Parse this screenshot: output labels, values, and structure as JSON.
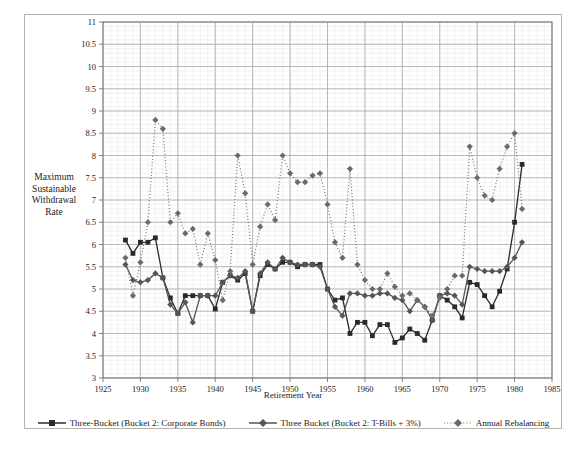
{
  "chart_data": {
    "type": "line",
    "title": "",
    "xlabel": "Retirement Year",
    "ylabel": "Maximum Sustainable Withdrawal Rate",
    "xlim": [
      1925,
      1985
    ],
    "ylim": [
      3,
      11
    ],
    "xticks": [
      1925,
      1930,
      1935,
      1940,
      1945,
      1950,
      1955,
      1960,
      1965,
      1970,
      1975,
      1980,
      1985
    ],
    "yticks": [
      3,
      3.5,
      4,
      4.5,
      5,
      5.5,
      6,
      6.5,
      7,
      7.5,
      8,
      8.5,
      9,
      9.5,
      10,
      10.5,
      11
    ],
    "grid": true,
    "minor_grid": true,
    "legend_position": "bottom",
    "x": [
      1928,
      1929,
      1930,
      1931,
      1932,
      1933,
      1934,
      1935,
      1936,
      1937,
      1938,
      1939,
      1940,
      1941,
      1942,
      1943,
      1944,
      1945,
      1946,
      1947,
      1948,
      1949,
      1950,
      1951,
      1952,
      1953,
      1954,
      1955,
      1956,
      1957,
      1958,
      1959,
      1960,
      1961,
      1962,
      1963,
      1964,
      1965,
      1966,
      1967,
      1968,
      1969,
      1970,
      1971,
      1972,
      1973,
      1974,
      1975,
      1976,
      1977,
      1978,
      1979,
      1980,
      1981
    ],
    "series": [
      {
        "name": "Three-Bucket (Bucket 2: Corporate Bonds)",
        "color": "#2a2a2a",
        "marker": "square",
        "line": "solid",
        "values": [
          6.1,
          5.8,
          6.05,
          6.05,
          6.15,
          5.25,
          4.8,
          4.45,
          4.85,
          4.85,
          4.85,
          4.85,
          4.55,
          5.15,
          5.3,
          5.2,
          5.35,
          4.5,
          5.3,
          5.55,
          5.45,
          5.6,
          5.6,
          5.5,
          5.55,
          5.55,
          5.55,
          5.0,
          4.75,
          4.8,
          4.0,
          4.25,
          4.25,
          3.95,
          4.2,
          4.2,
          3.8,
          3.9,
          4.1,
          4.0,
          3.85,
          4.3,
          4.85,
          4.75,
          4.6,
          4.35,
          5.15,
          5.1,
          4.85,
          4.6,
          4.95,
          5.45,
          6.5,
          7.8
        ]
      },
      {
        "name": "Three Bucket (Bucket 2: T-Bills + 3%)",
        "color": "#555555",
        "marker": "diamond",
        "line": "solid",
        "values": [
          5.55,
          5.2,
          5.15,
          5.2,
          5.35,
          5.25,
          4.65,
          4.45,
          4.7,
          4.25,
          4.85,
          4.85,
          4.85,
          5.15,
          5.3,
          5.25,
          5.4,
          4.5,
          5.35,
          5.6,
          5.45,
          5.7,
          5.6,
          5.55,
          5.55,
          5.55,
          5.5,
          5.0,
          4.6,
          4.4,
          4.9,
          4.9,
          4.85,
          4.85,
          4.9,
          4.9,
          4.8,
          4.75,
          4.5,
          4.75,
          4.6,
          4.3,
          4.85,
          4.9,
          4.85,
          4.65,
          5.5,
          5.45,
          5.4,
          5.4,
          5.4,
          5.5,
          5.7,
          6.05
        ]
      },
      {
        "name": "Annual Rebalancing",
        "color": "#6a6a6a",
        "marker": "diamond",
        "line": "dotted",
        "values": [
          5.7,
          4.85,
          5.6,
          6.5,
          8.8,
          8.6,
          6.5,
          6.7,
          6.25,
          6.35,
          5.55,
          6.25,
          5.65,
          4.75,
          5.4,
          8.0,
          7.15,
          5.55,
          6.4,
          6.9,
          6.55,
          8.0,
          7.6,
          7.4,
          7.4,
          7.55,
          7.6,
          6.9,
          6.05,
          5.7,
          7.7,
          5.55,
          5.2,
          5.0,
          5.0,
          5.35,
          5.05,
          4.85,
          4.9,
          4.75,
          4.6,
          4.4,
          4.8,
          5.0,
          5.3,
          5.3,
          8.2,
          7.5,
          7.1,
          7.0,
          7.7,
          8.2,
          8.5,
          6.8
        ]
      }
    ]
  },
  "axis": {
    "y_label_lines": [
      "Maximum",
      "Sustainable",
      "Withdrawal",
      "Rate"
    ],
    "x_title": "Retirement Year"
  },
  "legend": {
    "items": [
      {
        "label": "Three-Bucket (Bucket 2: Corporate Bonds)",
        "marker": "square",
        "line": "solid",
        "color": "#2a2a2a"
      },
      {
        "label": "Three Bucket (Bucket 2: T-Bills + 3%)",
        "marker": "diamond",
        "line": "solid",
        "color": "#555555"
      },
      {
        "label": "Annual Rebalancing",
        "marker": "diamond",
        "line": "dotted",
        "color": "#6a6a6a"
      }
    ]
  }
}
